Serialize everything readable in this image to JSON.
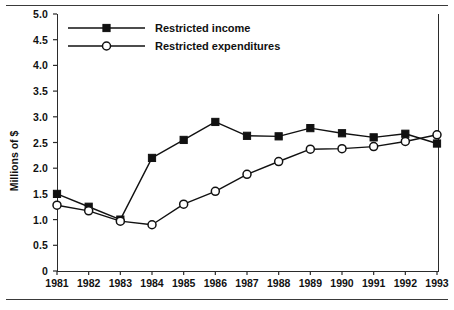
{
  "chart_data": {
    "type": "line",
    "title": "",
    "xlabel": "",
    "ylabel": "Millions of $",
    "categories": [
      "1981",
      "1982",
      "1983",
      "1984",
      "1985",
      "1986",
      "1987",
      "1988",
      "1989",
      "1990",
      "1991",
      "1992",
      "1993"
    ],
    "x": [
      1981,
      1982,
      1983,
      1984,
      1985,
      1986,
      1987,
      1988,
      1989,
      1990,
      1991,
      1992,
      1993
    ],
    "xlim": [
      1981,
      1993
    ],
    "ylim": [
      0,
      5.0
    ],
    "yticks": [
      0,
      0.5,
      1.0,
      1.5,
      2.0,
      2.5,
      3.0,
      3.5,
      4.0,
      4.5,
      5.0
    ],
    "ytick_labels": [
      "0",
      "0.5",
      "1.0",
      "1.5",
      "2.0",
      "2.5",
      "3.0",
      "3.5",
      "4.0",
      "4.5",
      "5.0"
    ],
    "grid": false,
    "legend_position": "top-left-inside",
    "series": [
      {
        "name": "Restricted income",
        "marker": "filled-square",
        "color": "#111111",
        "values": [
          1.5,
          1.25,
          1.0,
          2.2,
          2.55,
          2.9,
          2.63,
          2.62,
          2.78,
          2.68,
          2.6,
          2.67,
          2.48
        ]
      },
      {
        "name": "Restricted expenditures",
        "marker": "open-circle",
        "color": "#111111",
        "values": [
          1.28,
          1.17,
          0.97,
          0.9,
          1.3,
          1.55,
          1.88,
          2.13,
          2.37,
          2.38,
          2.42,
          2.52,
          2.65
        ]
      }
    ]
  },
  "legend": {
    "entries": [
      {
        "label": "Restricted income"
      },
      {
        "label": "Restricted expenditures"
      }
    ]
  }
}
